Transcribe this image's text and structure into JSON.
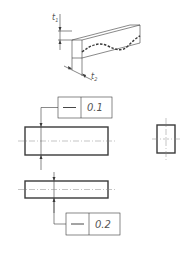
{
  "drawing": {
    "iso_view": {
      "label_t1": "t",
      "label_t1_sub": "1",
      "label_t2": "t",
      "label_t2_sub": "2"
    },
    "fcf_top": {
      "symbol": "straightness",
      "symbol_glyph": "—",
      "tolerance": "0.1"
    },
    "fcf_bottom": {
      "symbol": "straightness",
      "symbol_glyph": "—",
      "tolerance": "0.2"
    }
  },
  "colors": {
    "line": "#3a3a3a",
    "centerline": "#8a8a8a",
    "background": "#ffffff"
  }
}
